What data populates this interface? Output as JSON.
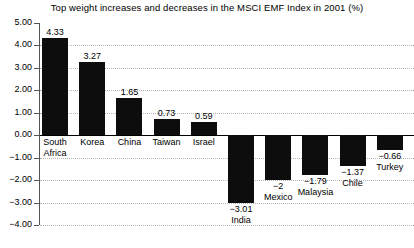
{
  "chart_data": {
    "type": "bar",
    "title": "Top weight increases and decreases in the MSCI EMF Index in 2001 (%)",
    "xlabel": "",
    "ylabel": "",
    "ylim": [
      -4.0,
      5.0
    ],
    "ytick_step": 1.0,
    "grid": true,
    "legend": "none",
    "orientation": "vertical",
    "bar_color": "#0d0d0d",
    "gridline_color": "#b4b4b4",
    "zeroline_color": "#000000",
    "categories": [
      "South Africa",
      "Korea",
      "China",
      "Taiwan",
      "Israel",
      "India",
      "Mexico",
      "Malaysia",
      "Chile",
      "Turkey"
    ],
    "values": [
      4.33,
      3.27,
      1.65,
      0.73,
      0.59,
      -3.01,
      -2,
      -1.79,
      -1.37,
      -0.66
    ],
    "value_labels": [
      "4.33",
      "3.27",
      "1.65",
      "0.73",
      "0.59",
      "−3.01",
      "−2",
      "−1.79",
      "−1.37",
      "−0.66"
    ],
    "category_label_lines": [
      [
        "South",
        "Africa"
      ],
      [
        "Korea"
      ],
      [
        "China"
      ],
      [
        "Taiwan"
      ],
      [
        "Israel"
      ],
      [
        "India"
      ],
      [
        "Mexico"
      ],
      [
        "Malaysia"
      ],
      [
        "Chile"
      ],
      [
        "Turkey"
      ]
    ],
    "ytick_labels": [
      "5.00",
      "4.00",
      "3.00",
      "2.00",
      "1.00",
      "0.00",
      "−1.00",
      "−2.00",
      "−3.00",
      "−4.00"
    ],
    "ytick_values": [
      5,
      4,
      3,
      2,
      1,
      0,
      -1,
      -2,
      -3,
      -4
    ]
  }
}
